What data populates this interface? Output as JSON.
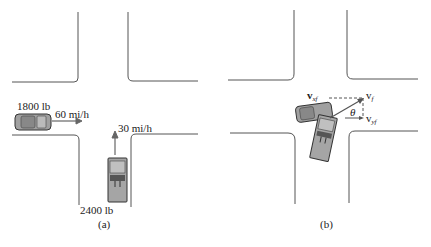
{
  "panel_a": {
    "caption": "(a)",
    "car_left": {
      "weight": "1800 lb",
      "speed": "60 mi/h"
    },
    "car_bottom": {
      "weight": "2400 lb",
      "speed": "30 mi/h"
    }
  },
  "panel_b": {
    "caption": "(b)",
    "vectors": {
      "vxf": {
        "main": "v",
        "sub": "xf"
      },
      "vf": {
        "main": "v",
        "sub": "f"
      },
      "vyf": {
        "main": "v",
        "sub": "yf"
      },
      "theta": "θ"
    }
  },
  "colors": {
    "road": "#555555",
    "car": "#9a9a9a",
    "arrow": "#666666"
  }
}
